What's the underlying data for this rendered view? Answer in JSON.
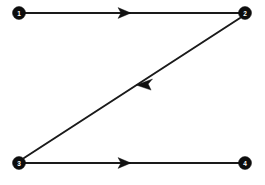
{
  "diagram": {
    "type": "directed-graph",
    "background_color": "#ffffff",
    "node_color": "#0d0d0d",
    "node_label_color": "#ffffff",
    "edge_color": "#1a1a1a",
    "arrow_color": "#111111",
    "canvas": {
      "width": 265,
      "height": 185
    },
    "nodes": [
      {
        "id": "n1",
        "label": "1",
        "x": 19,
        "y": 13,
        "r": 6.5
      },
      {
        "id": "n2",
        "label": "2",
        "x": 245,
        "y": 13,
        "r": 6.5
      },
      {
        "id": "n3",
        "label": "3",
        "x": 19,
        "y": 163,
        "r": 6.5
      },
      {
        "id": "n4",
        "label": "4",
        "x": 245,
        "y": 163,
        "r": 6.5
      }
    ],
    "edges": [
      {
        "id": "e1",
        "from": "n1",
        "to": "n2",
        "directed": true,
        "orientation": "horizontal",
        "x1": 25,
        "y1": 13,
        "x2": 239,
        "y2": 13,
        "arrow_x": 131,
        "arrow_y": 13,
        "arrow_angle": 0
      },
      {
        "id": "e2",
        "from": "n2",
        "to": "n3",
        "directed": true,
        "orientation": "diagonal",
        "x1": 240,
        "y1": 18,
        "x2": 24,
        "y2": 158,
        "arrow_x": 136,
        "arrow_y": 85,
        "arrow_angle": 147
      },
      {
        "id": "e3",
        "from": "n3",
        "to": "n4",
        "directed": true,
        "orientation": "horizontal",
        "x1": 25,
        "y1": 163,
        "x2": 239,
        "y2": 163,
        "arrow_x": 131,
        "arrow_y": 163,
        "arrow_angle": 0
      }
    ]
  }
}
